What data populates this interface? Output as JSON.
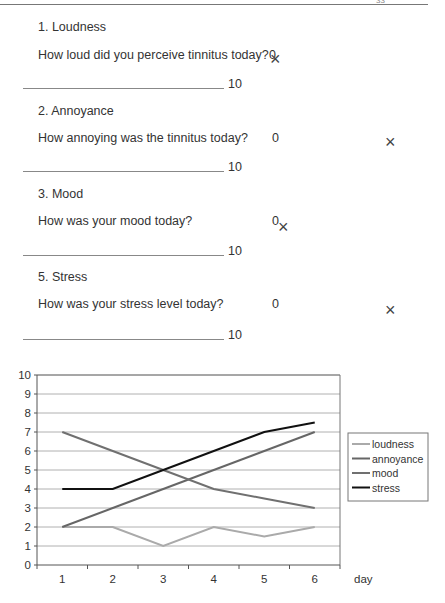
{
  "header": {
    "page_number": "33"
  },
  "questions": [
    {
      "title": "1. Loudness",
      "question": "How loud did you perceive tinnitus today?",
      "min_label": "0",
      "max_label": "10"
    },
    {
      "title": "2. Annoyance",
      "question": "How annoying was the tinnitus today?",
      "min_label": "0",
      "max_label": "10"
    },
    {
      "title": "3. Mood",
      "question": "How was your mood today?",
      "min_label": "0",
      "max_label": "10"
    },
    {
      "title": "5. Stress",
      "question": "How was your stress level today?",
      "min_label": "0",
      "max_label": "10"
    }
  ],
  "marks": [
    "×",
    "×",
    "×",
    "×"
  ],
  "chart_data": {
    "type": "line",
    "title": "",
    "xlabel": "day",
    "ylabel": "",
    "x": [
      1,
      2,
      3,
      4,
      5,
      6
    ],
    "ylim": [
      0,
      10
    ],
    "yticks": [
      0,
      1,
      2,
      3,
      4,
      5,
      6,
      7,
      8,
      9,
      10
    ],
    "grid": true,
    "legend_position": "right",
    "series": [
      {
        "name": "loudness",
        "values": [
          2,
          2,
          1,
          2,
          1.5,
          2
        ],
        "color": "#aaaaaa"
      },
      {
        "name": "annoyance",
        "values": [
          2,
          3,
          4,
          5,
          6,
          7
        ],
        "color": "#666666"
      },
      {
        "name": "mood",
        "values": [
          7,
          6,
          5,
          4,
          3.5,
          3
        ],
        "color": "#707070"
      },
      {
        "name": "stress",
        "values": [
          4,
          4,
          5,
          6,
          7,
          7.5
        ],
        "color": "#111111"
      }
    ]
  }
}
